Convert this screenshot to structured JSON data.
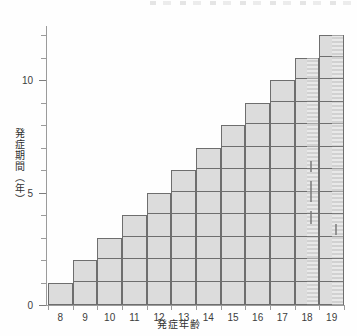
{
  "chart_data": {
    "type": "bar",
    "title": "",
    "subtitle": "",
    "xlabel": "発症年齢",
    "ylabel": "発症期間（年）",
    "categories": [
      "8",
      "9",
      "10",
      "11",
      "12",
      "13",
      "14",
      "15",
      "16",
      "17",
      "18",
      "19"
    ],
    "values": [
      1,
      2,
      3,
      4,
      5,
      6,
      7,
      8,
      9,
      10,
      11,
      12
    ],
    "series": [
      {
        "name": "発症期間",
        "values": [
          1,
          2,
          3,
          4,
          5,
          6,
          7,
          8,
          9,
          10,
          11,
          12
        ]
      }
    ],
    "xlim": [
      7.5,
      19.5
    ],
    "ylim": [
      0,
      12.4
    ],
    "ytick_labels": [
      "0",
      "5",
      "10"
    ],
    "ytick_values": [
      0,
      5,
      10
    ],
    "yminor_tick_step": 1,
    "grid": false,
    "legend": null,
    "annotations": [],
    "bar_fill_color": "#dcdcdc",
    "bar_edge_color": "#6e6e6e",
    "axis_color": "#9b9b9b",
    "background_color": "#ffffff"
  },
  "axes": {
    "y_title": "発症期間（年）",
    "x_title": "発症年齢",
    "y_major_ticks": [
      {
        "value": 0,
        "label": "0"
      },
      {
        "value": 5,
        "label": "5"
      },
      {
        "value": 10,
        "label": "10"
      }
    ],
    "y_minor_ticks": [
      1,
      2,
      3,
      4,
      6,
      7,
      8,
      9,
      11,
      12
    ],
    "x_ticks": [
      {
        "value": "8",
        "label": "8"
      },
      {
        "value": "9",
        "label": "9"
      },
      {
        "value": "10",
        "label": "10"
      },
      {
        "value": "11",
        "label": "11"
      },
      {
        "value": "12",
        "label": "12"
      },
      {
        "value": "13",
        "label": "13"
      },
      {
        "value": "14",
        "label": "14"
      },
      {
        "value": "15",
        "label": "15"
      },
      {
        "value": "16",
        "label": "16"
      },
      {
        "value": "17",
        "label": "17"
      },
      {
        "value": "18",
        "label": "18"
      },
      {
        "value": "19",
        "label": "19"
      }
    ]
  }
}
